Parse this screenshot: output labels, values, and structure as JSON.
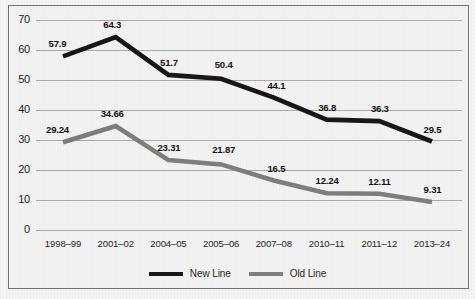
{
  "chart_data": {
    "type": "line",
    "title": "",
    "subtitle": "",
    "xlabel": "",
    "ylabel": "",
    "categories": [
      "1998–99",
      "2001–02",
      "2004–05",
      "2005–06",
      "2007–08",
      "2010–11",
      "2011–12",
      "2013–24"
    ],
    "ylim": [
      0,
      70
    ],
    "yticks": [
      0,
      10,
      20,
      30,
      40,
      50,
      60,
      70
    ],
    "grid": "horizontal",
    "legend_position": "bottom-center",
    "series": [
      {
        "name": "New Line",
        "color": "#171717",
        "values": [
          57.9,
          64.3,
          51.7,
          50.4,
          44.1,
          36.8,
          36.3,
          29.5
        ],
        "labels": [
          "57.9",
          "64.3",
          "51.7",
          "50.4",
          "44.1",
          "36.8",
          "36.3",
          "29.5"
        ]
      },
      {
        "name": "Old Line",
        "color": "#7d7d7d",
        "values": [
          29.24,
          34.66,
          23.31,
          21.87,
          16.5,
          12.24,
          12.11,
          9.31
        ],
        "labels": [
          "29.24",
          "34.66",
          "23.31",
          "21.87",
          "16.5",
          "12.24",
          "12.11",
          "9.31"
        ]
      }
    ]
  },
  "legend": {
    "items": [
      {
        "label": "New Line",
        "color": "#171717"
      },
      {
        "label": "Old Line",
        "color": "#7d7d7d"
      }
    ]
  }
}
